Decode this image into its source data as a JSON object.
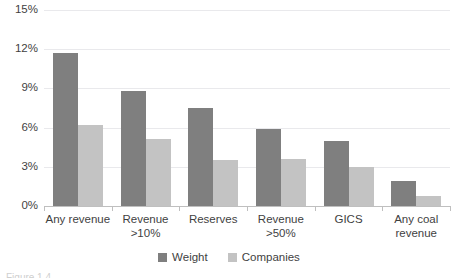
{
  "chart_data": {
    "type": "bar",
    "title": "",
    "xlabel": "",
    "ylabel": "",
    "categories": [
      "Any revenue",
      "Revenue\n>10%",
      "Reserves",
      "Revenue\n>50%",
      "GICS",
      "Any coal\nrevenue"
    ],
    "series": [
      {
        "name": "Weight",
        "color": "#7f7f7f",
        "values": [
          11.7,
          8.8,
          7.5,
          5.9,
          5.0,
          1.9
        ]
      },
      {
        "name": "Companies",
        "color": "#c3c3c3",
        "values": [
          6.2,
          5.1,
          3.5,
          3.6,
          3.0,
          0.8
        ]
      }
    ],
    "ylim": [
      0,
      15
    ],
    "ytick_labels": [
      "0%",
      "3%",
      "6%",
      "9%",
      "12%",
      "15%"
    ],
    "ytick_values": [
      0,
      3,
      6,
      9,
      12,
      15
    ],
    "grid": true,
    "legend_position": "bottom"
  },
  "caption": {
    "fragment": "Figure 1.4"
  }
}
